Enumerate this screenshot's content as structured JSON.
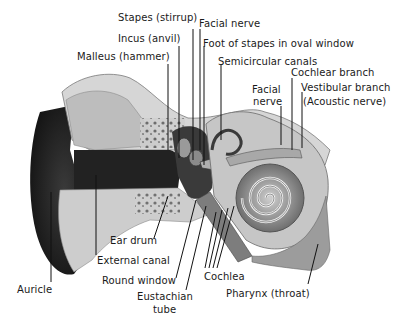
{
  "labels": {
    "stapes": "Stapes (stirrup)",
    "facial_nerve_top": "Facial nerve",
    "incus": "Incus (anvil)",
    "foot_of_stapes": "Foot of stapes in oval window",
    "malleus": "Malleus (hammer)",
    "semicircular_canals": "Semicircular canals",
    "cochlear_branch": "Cochlear branch",
    "facial_nerve_right_1": "Facial",
    "facial_nerve_right_2": "nerve",
    "vestibular_branch": "Vestibular branch",
    "acoustic_nerve": "(Acoustic nerve)",
    "ear_drum": "Ear drum",
    "external_canal": "External canal",
    "round_window": "Round window",
    "cochlea": "Cochlea",
    "auricle": "Auricle",
    "eustachian_1": "Eustachian",
    "eustachian_2": "tube",
    "pharynx": "Pharynx (throat)"
  },
  "colors": {
    "ink": "#1a1a1a",
    "dark_tissue": "#2b2b2b",
    "bone": "#d8d8d8",
    "cartilage": "#bcbcbc",
    "background": "#ffffff"
  }
}
